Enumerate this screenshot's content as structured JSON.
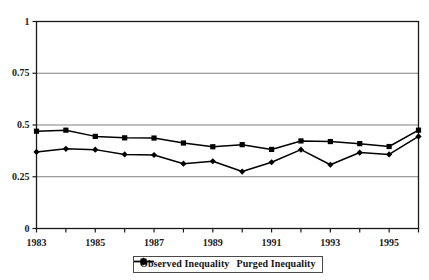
{
  "chart_data": {
    "type": "line",
    "title": "",
    "subtitle": "",
    "xlabel": "",
    "ylabel": "",
    "ylim": [
      0,
      1
    ],
    "yticks": [
      "0",
      "0.25",
      "0.5",
      "0.75",
      "1"
    ],
    "ytick_values": [
      0,
      0.25,
      0.5,
      0.75,
      1
    ],
    "x": [
      1983,
      1984,
      1985,
      1986,
      1987,
      1988,
      1989,
      1990,
      1991,
      1992,
      1993,
      1994,
      1995,
      1996
    ],
    "xticks": [
      "1983",
      "1985",
      "1987",
      "1989",
      "1991",
      "1993",
      "1995"
    ],
    "xtick_values": [
      1983,
      1985,
      1987,
      1989,
      1991,
      1993,
      1995
    ],
    "xlim": [
      1983,
      1996
    ],
    "grid": "horizontal",
    "legend_position": "below-bottom-center",
    "series": [
      {
        "name": "Observed Inequality",
        "marker": "square",
        "color": "#000000",
        "values": [
          0.47,
          0.475,
          0.445,
          0.438,
          0.437,
          0.413,
          0.395,
          0.405,
          0.382,
          0.423,
          0.42,
          0.41,
          0.396,
          0.475
        ]
      },
      {
        "name": "Purged Inequality",
        "marker": "diamond",
        "color": "#000000",
        "values": [
          0.37,
          0.385,
          0.381,
          0.358,
          0.355,
          0.313,
          0.325,
          0.275,
          0.32,
          0.381,
          0.308,
          0.367,
          0.358,
          0.445
        ]
      }
    ]
  },
  "legend": {
    "items": [
      {
        "label": "Observed Inequality",
        "marker": "square"
      },
      {
        "label": "Purged Inequality",
        "marker": "diamond"
      }
    ]
  },
  "colors": {
    "line": "#000000",
    "grid": "#808080",
    "axis": "#1a1a1a",
    "background": "#ffffff"
  }
}
